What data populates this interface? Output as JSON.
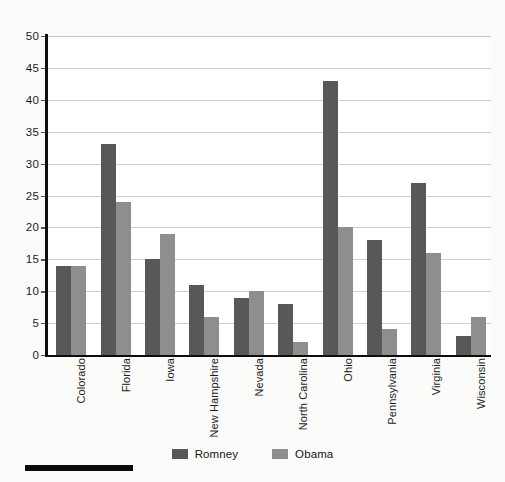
{
  "chart_data": {
    "type": "bar",
    "title": "",
    "subtitle": "",
    "xlabel": "",
    "ylabel": "",
    "ylim": [
      0,
      50
    ],
    "ytick_step": 5,
    "yticks": [
      0,
      5,
      10,
      15,
      20,
      25,
      30,
      35,
      40,
      45,
      50
    ],
    "ytick_labels": [
      "0",
      "5",
      "10",
      "15",
      "20",
      "25",
      "30",
      "35",
      "40",
      "45",
      "50"
    ],
    "grid": true,
    "grid_axis": "y",
    "legend_position": "bottom-center",
    "xtick_rotation": -90,
    "categories": [
      "Colorado",
      "Florida",
      "Iowa",
      "New Hampshire",
      "Nevada",
      "North Carolina",
      "Ohio",
      "Pennsylvania",
      "Virginia",
      "Wisconsin"
    ],
    "series": [
      {
        "name": "Romney",
        "color": "#58585a",
        "values": [
          14,
          33,
          15,
          11,
          9,
          8,
          43,
          18,
          27,
          3
        ]
      },
      {
        "name": "Obama",
        "color": "#8e8e90",
        "values": [
          14,
          24,
          19,
          6,
          10,
          2,
          20,
          4,
          16,
          6
        ]
      }
    ]
  },
  "legend": {
    "items": [
      {
        "label": "Romney",
        "color": "#58585a"
      },
      {
        "label": "Obama",
        "color": "#8e8e90"
      }
    ]
  },
  "colors": {
    "background": "#fbfbf9",
    "plot_background": "#ffffff",
    "axis": "#0d0d0d",
    "gridline": "#cfcfcf",
    "text": "#1c1c1c",
    "footer_rule": "#0a0a0a"
  },
  "footer": {
    "rule_present": true
  }
}
